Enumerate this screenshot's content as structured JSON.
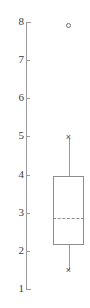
{
  "chart_data": {
    "type": "box",
    "title": "",
    "xlabel": "",
    "ylabel": "",
    "ylim": [
      1,
      8
    ],
    "grid": false,
    "legend": null,
    "y_ticks": [
      8,
      7,
      6,
      5,
      4,
      3,
      2,
      1
    ],
    "y_tick_labels": [
      "8",
      "7",
      "6",
      "5",
      "4",
      "3",
      "2",
      "1"
    ],
    "categories": [
      ""
    ],
    "boxes": [
      {
        "name": "",
        "whisker_low": 1.5,
        "q1": 2.15,
        "median": 2.85,
        "q3": 3.95,
        "whisker_high": 4.95,
        "outliers": [
          7.9
        ],
        "median_style": "dashed",
        "whisker_cap_marker": "x",
        "outlier_marker": "open-circle"
      }
    ]
  },
  "style": {
    "axis_color": "#9a9a9a",
    "box_color": "#8d8d8d",
    "label_color": "#3a3a3a",
    "marker_color": "#4a4a4a",
    "outlier_color": "#6f6f6f",
    "background": "#ffffff"
  },
  "markers": {
    "whisker_cap_glyph": "×"
  }
}
